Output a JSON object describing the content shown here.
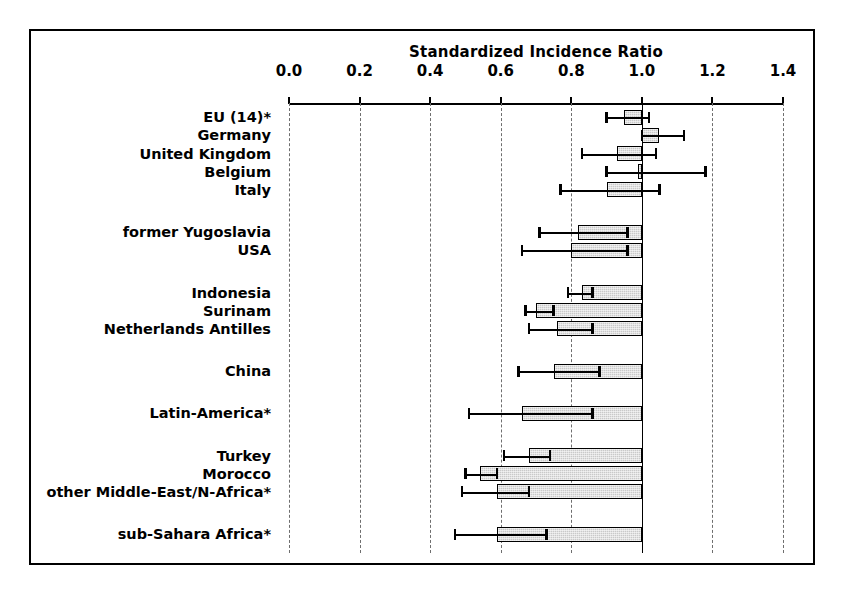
{
  "chart_data": {
    "type": "bar",
    "orientation": "horizontal",
    "title": "Standardized Incidence Ratio",
    "xlabel": "",
    "ylabel": "",
    "xlim": [
      0.0,
      1.4
    ],
    "xticks": [
      "0.0",
      "0.2",
      "0.4",
      "0.6",
      "0.8",
      "1.0",
      "1.2",
      "1.4"
    ],
    "xtick_values": [
      0.0,
      0.2,
      0.4,
      0.6,
      0.8,
      1.0,
      1.2,
      1.4
    ],
    "grid": "vertical dashed gridlines at each tick",
    "reference_value": 1.0,
    "legend": "none",
    "note": "Bars are drawn from the reference line at 1.0 to the point estimate; horizontal whiskers show the 95% confidence interval.",
    "categories": [
      "EU (14)*",
      "Germany",
      "United Kingdom",
      "Belgium",
      "Italy",
      "former Yugoslavia",
      "USA",
      "Indonesia",
      "Surinam",
      "Netherlands Antilles",
      "China",
      "Latin-America*",
      "Turkey",
      "Morocco",
      "other Middle-East/N-Africa*",
      "sub-Sahara Africa*"
    ],
    "values": [
      0.95,
      1.05,
      0.93,
      0.99,
      0.9,
      0.82,
      0.8,
      0.83,
      0.7,
      0.76,
      0.75,
      0.66,
      0.68,
      0.54,
      0.59,
      0.59
    ],
    "ci_low": [
      0.9,
      1.0,
      0.83,
      0.9,
      0.77,
      0.71,
      0.66,
      0.79,
      0.67,
      0.68,
      0.65,
      0.51,
      0.61,
      0.5,
      0.49,
      0.47
    ],
    "ci_high": [
      1.02,
      1.12,
      1.04,
      1.18,
      1.05,
      0.96,
      0.96,
      0.86,
      0.75,
      0.86,
      0.88,
      0.86,
      0.74,
      0.59,
      0.68,
      0.73
    ],
    "groups": [
      {
        "rows": [
          0,
          1,
          2,
          3,
          4
        ]
      },
      {
        "rows": [
          5,
          6
        ]
      },
      {
        "rows": [
          7,
          8,
          9
        ]
      },
      {
        "rows": [
          10
        ]
      },
      {
        "rows": [
          11
        ]
      },
      {
        "rows": [
          12,
          13,
          14
        ]
      },
      {
        "rows": [
          15
        ]
      }
    ],
    "colors": {
      "bar_fill": "#c9c9c9",
      "bar_edge": "#000000",
      "gridline": "#6e6e6e",
      "axis": "#000000",
      "text": "#000000",
      "background": "#ffffff"
    }
  }
}
